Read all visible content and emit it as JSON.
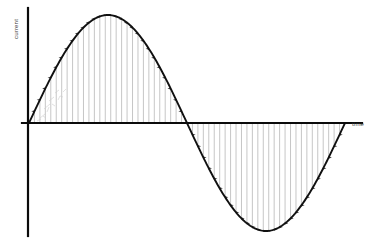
{
  "figure": {
    "title": "",
    "background_color": "#ffffff",
    "ink_color": "#111111",
    "hatch_color": "#b9b9b9"
  },
  "axes": {
    "y_label": "current",
    "x_label": "time",
    "y_axis_x_px": 28,
    "x_axis_y_px": 123,
    "y_axis_top_px": 8,
    "y_axis_bottom_px": 236,
    "x_axis_left_px": 22,
    "x_axis_right_px": 362
  },
  "chart_data": {
    "type": "line",
    "title": "",
    "xlabel": "time",
    "ylabel": "current",
    "grid": false,
    "legend": null,
    "xlim": [
      0,
      1
    ],
    "ylim": [
      -1,
      1
    ],
    "annotations": [
      "vertical arrows drawn from the time axis up to the curve in the positive half-cycle (arrowheads point up)",
      "vertical arrows drawn from the time axis down to the curve in the negative half-cycle (arrowheads point down)",
      "one complete sine cycle is shown"
    ],
    "series": [
      {
        "name": "current",
        "kind": "sine",
        "amplitude": 1.0,
        "cycles": 1,
        "phase": 0,
        "x": [
          0,
          0.05,
          0.1,
          0.15,
          0.2,
          0.25,
          0.3,
          0.35,
          0.4,
          0.45,
          0.5,
          0.55,
          0.6,
          0.65,
          0.7,
          0.75,
          0.8,
          0.85,
          0.9,
          0.95,
          1.0
        ],
        "values": [
          0,
          0.309,
          0.588,
          0.809,
          0.951,
          1.0,
          0.951,
          0.809,
          0.588,
          0.309,
          0,
          -0.309,
          -0.588,
          -0.809,
          -0.951,
          -1.0,
          -0.951,
          -0.809,
          -0.588,
          -0.309,
          0
        ]
      }
    ],
    "hatch_arrows": {
      "count_positive": 28,
      "count_negative": 28,
      "direction_positive": "up",
      "direction_negative": "down"
    }
  }
}
